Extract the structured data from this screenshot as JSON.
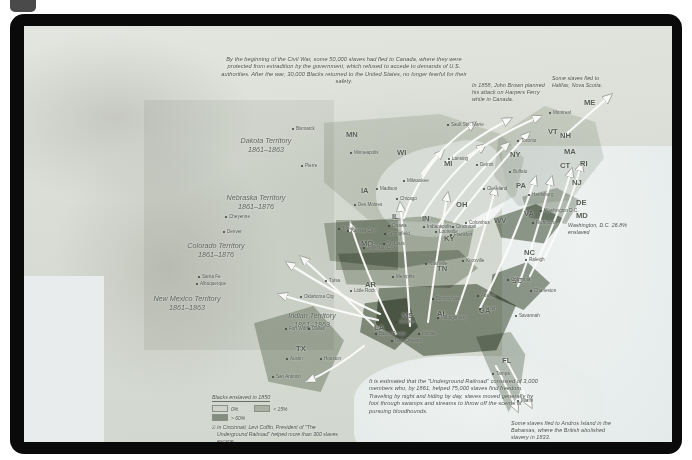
{
  "document": {
    "title": "The Underground Railroad and Escape Routes from Slavery"
  },
  "notes": {
    "canada_flight": "By the beginning of the Civil War, some 50,000 slaves had fled to Canada, where they were protected from extradition by the government, which refused to accede to demands of U.S. authorities. After the war, 30,000 Blacks returned to the United States, no longer fearful for their safety.",
    "john_brown": "In 1858, John Brown planned his attack on Harpers Ferry while in Canada.",
    "halifax": "Some slaves fled to Halifax, Nova Scotia.",
    "underground_railroad": "It is estimated that the \"Underground Railroad\" consisted of 3,000 members who, by 1861, helped 75,000 slaves find freedom. Traveling by night and hiding by day, slaves moved generally by foot through swamps and streams to throw off the scents of pursuing bloodhounds.",
    "andros": "Some slaves fled to Andros Island in the Bahamas, where the British abolished slavery in 1833.",
    "washington_dc": "Washington, D.C. 26.8% enslaved"
  },
  "legend": {
    "title": "Blacks enslaved in 1850",
    "items": [
      {
        "label": "0%",
        "color": "#ced2c8"
      },
      {
        "label": "< 15%",
        "color": "#a8b0a2"
      },
      {
        "label": "> 60%",
        "color": "#848e7e"
      }
    ],
    "footnote": "In Cincinnati, Levi Coffin, President of \"The Underground Railroad\" helped more than 300 slaves escape."
  },
  "territories": [
    {
      "name": "Dakota Territory",
      "years": "1861–1863",
      "x": 239,
      "y": 110
    },
    {
      "name": "Nebraska Territory",
      "years": "1861–1876",
      "x": 229,
      "y": 167
    },
    {
      "name": "Colorado Territory",
      "years": "1861–1876",
      "x": 189,
      "y": 215
    },
    {
      "name": "New Mexico Territory",
      "years": "1861–1863",
      "x": 160,
      "y": 268
    },
    {
      "name": "Indian Territory",
      "years": "1861–1863",
      "x": 285,
      "y": 285
    }
  ],
  "states": [
    {
      "abbr": "MN",
      "x": 322,
      "y": 104
    },
    {
      "abbr": "WI",
      "x": 373,
      "y": 122
    },
    {
      "abbr": "IA",
      "x": 337,
      "y": 160
    },
    {
      "abbr": "MI",
      "x": 420,
      "y": 133
    },
    {
      "abbr": "IL",
      "x": 368,
      "y": 186
    },
    {
      "abbr": "IN",
      "x": 398,
      "y": 188
    },
    {
      "abbr": "OH",
      "x": 432,
      "y": 174
    },
    {
      "abbr": "MO",
      "x": 337,
      "y": 213
    },
    {
      "abbr": "KY",
      "x": 420,
      "y": 208
    },
    {
      "abbr": "WV",
      "x": 470,
      "y": 190
    },
    {
      "abbr": "VA",
      "x": 500,
      "y": 183
    },
    {
      "abbr": "TN",
      "x": 413,
      "y": 238
    },
    {
      "abbr": "NC",
      "x": 500,
      "y": 222
    },
    {
      "abbr": "SC",
      "x": 488,
      "y": 250
    },
    {
      "abbr": "AR",
      "x": 341,
      "y": 254
    },
    {
      "abbr": "MS",
      "x": 378,
      "y": 285
    },
    {
      "abbr": "AL",
      "x": 413,
      "y": 283
    },
    {
      "abbr": "GA",
      "x": 455,
      "y": 280
    },
    {
      "abbr": "LA",
      "x": 350,
      "y": 297
    },
    {
      "abbr": "TX",
      "x": 272,
      "y": 318
    },
    {
      "abbr": "FL",
      "x": 478,
      "y": 330
    },
    {
      "abbr": "PA",
      "x": 492,
      "y": 155
    },
    {
      "abbr": "NY",
      "x": 486,
      "y": 124
    },
    {
      "abbr": "ME",
      "x": 560,
      "y": 72
    },
    {
      "abbr": "VT",
      "x": 524,
      "y": 101
    },
    {
      "abbr": "NH",
      "x": 536,
      "y": 105
    },
    {
      "abbr": "MA",
      "x": 540,
      "y": 121
    },
    {
      "abbr": "CT",
      "x": 536,
      "y": 135
    },
    {
      "abbr": "RI",
      "x": 556,
      "y": 133
    },
    {
      "abbr": "NJ",
      "x": 548,
      "y": 152
    },
    {
      "abbr": "DE",
      "x": 552,
      "y": 172
    },
    {
      "abbr": "MD",
      "x": 552,
      "y": 185
    }
  ],
  "cities": [
    {
      "name": "Bismarck",
      "x": 272,
      "y": 100
    },
    {
      "name": "Pierre",
      "x": 281,
      "y": 137
    },
    {
      "name": "Minneapolis",
      "x": 330,
      "y": 124
    },
    {
      "name": "Sault Ste. Marie",
      "x": 427,
      "y": 96
    },
    {
      "name": "Montreal",
      "x": 529,
      "y": 84
    },
    {
      "name": "Toronto",
      "x": 497,
      "y": 112
    },
    {
      "name": "Detroit",
      "x": 456,
      "y": 136
    },
    {
      "name": "Lansing",
      "x": 428,
      "y": 130
    },
    {
      "name": "Milwaukee",
      "x": 383,
      "y": 152
    },
    {
      "name": "Chicago",
      "x": 376,
      "y": 170
    },
    {
      "name": "Madison",
      "x": 356,
      "y": 160
    },
    {
      "name": "Des Moines",
      "x": 334,
      "y": 176
    },
    {
      "name": "Ottawa",
      "x": 368,
      "y": 197
    },
    {
      "name": "Indianapolis",
      "x": 403,
      "y": 198
    },
    {
      "name": "Springfield",
      "x": 364,
      "y": 205
    },
    {
      "name": "Columbus",
      "x": 445,
      "y": 194
    },
    {
      "name": "Cleveland",
      "x": 463,
      "y": 160
    },
    {
      "name": "Buffalo",
      "x": 489,
      "y": 143
    },
    {
      "name": "Topeka",
      "x": 318,
      "y": 200
    },
    {
      "name": "Kansas City",
      "x": 327,
      "y": 202
    },
    {
      "name": "St. Louis",
      "x": 363,
      "y": 215
    },
    {
      "name": "Jefferson City",
      "x": 343,
      "y": 219
    },
    {
      "name": "Cincinnati",
      "x": 432,
      "y": 198
    },
    {
      "name": "Frankfort",
      "x": 430,
      "y": 206
    },
    {
      "name": "Louisville",
      "x": 415,
      "y": 203
    },
    {
      "name": "Richmond",
      "x": 512,
      "y": 194
    },
    {
      "name": "Nashville",
      "x": 405,
      "y": 235
    },
    {
      "name": "Knoxville",
      "x": 442,
      "y": 232
    },
    {
      "name": "Memphis",
      "x": 372,
      "y": 248
    },
    {
      "name": "Raleigh",
      "x": 505,
      "y": 231
    },
    {
      "name": "Charleston",
      "x": 510,
      "y": 262
    },
    {
      "name": "Columbia",
      "x": 487,
      "y": 251
    },
    {
      "name": "Atlanta",
      "x": 457,
      "y": 267
    },
    {
      "name": "Macon",
      "x": 459,
      "y": 280
    },
    {
      "name": "Birmingham",
      "x": 412,
      "y": 270
    },
    {
      "name": "Montgomery",
      "x": 417,
      "y": 289
    },
    {
      "name": "Jackson",
      "x": 375,
      "y": 293
    },
    {
      "name": "Savannah",
      "x": 495,
      "y": 287
    },
    {
      "name": "Mobile",
      "x": 398,
      "y": 305
    },
    {
      "name": "Baton Rouge",
      "x": 355,
      "y": 305
    },
    {
      "name": "New Orleans",
      "x": 371,
      "y": 312
    },
    {
      "name": "Little Rock",
      "x": 330,
      "y": 262
    },
    {
      "name": "Tulsa",
      "x": 305,
      "y": 252
    },
    {
      "name": "Oklahoma City",
      "x": 280,
      "y": 268
    },
    {
      "name": "Fort Worth",
      "x": 265,
      "y": 300
    },
    {
      "name": "Dallas",
      "x": 288,
      "y": 300
    },
    {
      "name": "Austin",
      "x": 266,
      "y": 330
    },
    {
      "name": "San Antonio",
      "x": 252,
      "y": 348
    },
    {
      "name": "Houston",
      "x": 300,
      "y": 330
    },
    {
      "name": "Denver",
      "x": 203,
      "y": 203
    },
    {
      "name": "Cheyenne",
      "x": 205,
      "y": 188
    },
    {
      "name": "Santa Fe",
      "x": 178,
      "y": 248
    },
    {
      "name": "Albuquerque",
      "x": 176,
      "y": 255
    },
    {
      "name": "Tampa",
      "x": 472,
      "y": 345
    },
    {
      "name": "Miami",
      "x": 497,
      "y": 372
    },
    {
      "name": "Washington D.C.",
      "x": 520,
      "y": 182
    },
    {
      "name": "Harrisburg",
      "x": 508,
      "y": 166
    }
  ]
}
